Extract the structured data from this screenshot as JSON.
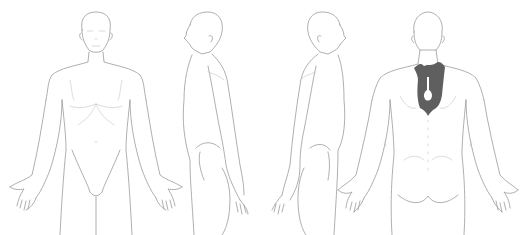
{
  "figure": {
    "type": "body-pain-map",
    "views": [
      {
        "id": "front",
        "label": "Front view"
      },
      {
        "id": "right-side",
        "label": "Right side view"
      },
      {
        "id": "left-side",
        "label": "Left side view"
      },
      {
        "id": "back",
        "label": "Back view"
      }
    ],
    "highlight": {
      "view": "back",
      "region": "upper back / lower neck (cervicothoracic)",
      "color": "#5f5f5f"
    },
    "line_color": "#9a9a9a",
    "background": "#ffffff"
  }
}
